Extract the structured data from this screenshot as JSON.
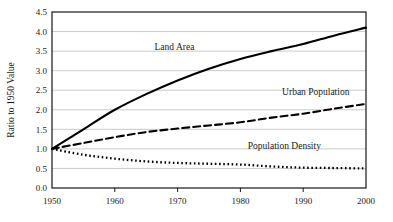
{
  "chart_data": {
    "type": "line",
    "title": "",
    "xlabel": "",
    "ylabel": "Ratio to 1950 Value",
    "xlim": [
      1950,
      2000
    ],
    "ylim": [
      0.0,
      4.5
    ],
    "grid": true,
    "legend_position": "inline-annotations",
    "x_ticks": [
      1950,
      1960,
      1970,
      1980,
      1990,
      2000
    ],
    "x_tick_labels": [
      "1950",
      "1960",
      "1970",
      "1980",
      "1990",
      "2000"
    ],
    "y_ticks": [
      0.0,
      0.5,
      1.0,
      1.5,
      2.0,
      2.5,
      3.0,
      3.5,
      4.0,
      4.5
    ],
    "y_tick_labels": [
      "0.0",
      "0.5",
      "1.0",
      "1.5",
      "2.0",
      "2.5",
      "3.0",
      "3.5",
      "4.0",
      "4.5"
    ],
    "x": [
      1950,
      1955,
      1960,
      1965,
      1970,
      1975,
      1980,
      1985,
      1990,
      1995,
      2000
    ],
    "series": [
      {
        "name": "Land Area",
        "style": "solid",
        "color": "#000000",
        "values": [
          1.0,
          1.5,
          2.0,
          2.4,
          2.75,
          3.05,
          3.3,
          3.5,
          3.68,
          3.9,
          4.1
        ]
      },
      {
        "name": "Urban Population",
        "style": "dashed",
        "color": "#000000",
        "values": [
          1.0,
          1.15,
          1.3,
          1.43,
          1.52,
          1.6,
          1.68,
          1.8,
          1.9,
          2.03,
          2.15
        ]
      },
      {
        "name": "Population Density",
        "style": "dotted",
        "color": "#000000",
        "values": [
          1.0,
          0.85,
          0.75,
          0.68,
          0.64,
          0.62,
          0.6,
          0.55,
          0.52,
          0.51,
          0.5
        ]
      }
    ],
    "annotations": [
      {
        "text": "Land Area",
        "x": 1969.5,
        "y": 3.52
      },
      {
        "text": "Urban Population",
        "x": 1992.0,
        "y": 2.38
      },
      {
        "text": "Population Density",
        "x": 1987.0,
        "y": 0.99
      }
    ]
  }
}
